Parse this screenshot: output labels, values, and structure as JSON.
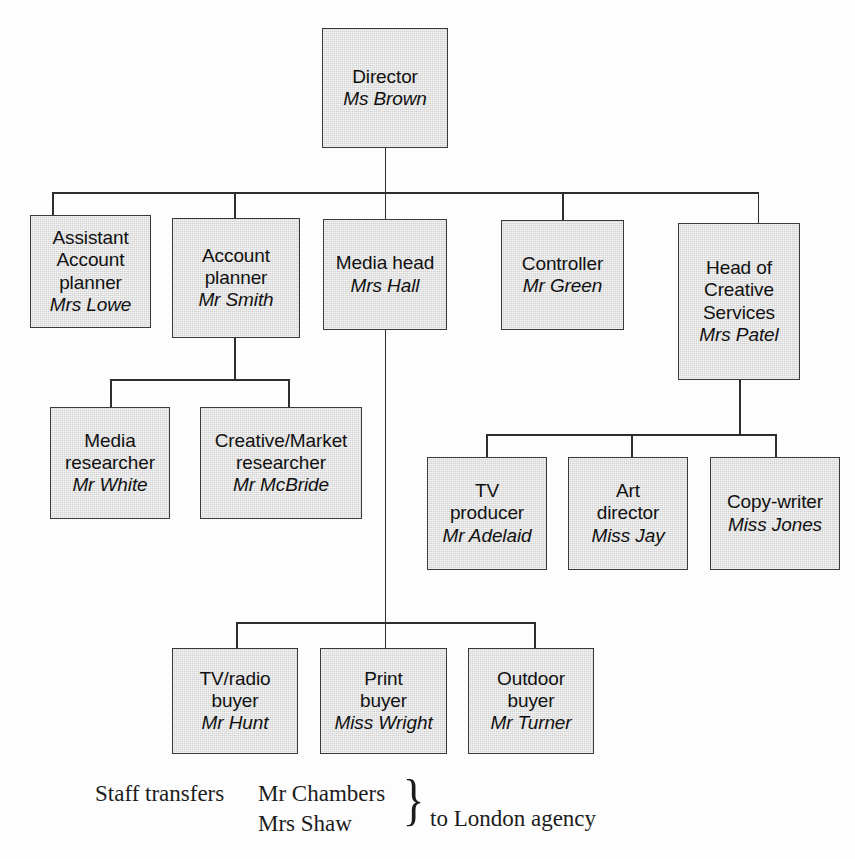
{
  "document": {
    "type": "organisation-chart",
    "clipped_header": ""
  },
  "nodes": {
    "director": {
      "role": "Director",
      "person": "Ms Brown"
    },
    "assistant_planner": {
      "role": "Assistant\nAccount\nplanner",
      "person": "Mrs Lowe"
    },
    "account_planner": {
      "role": "Account\nplanner",
      "person": "Mr Smith"
    },
    "media_head": {
      "role": "Media head",
      "person": "Mrs Hall"
    },
    "controller": {
      "role": "Controller",
      "person": "Mr Green"
    },
    "creative_head": {
      "role": "Head of\nCreative\nServices",
      "person": "Mrs Patel"
    },
    "media_researcher": {
      "role": "Media\nresearcher",
      "person": "Mr White"
    },
    "creative_researcher": {
      "role": "Creative/Market\nresearcher",
      "person": "Mr McBride"
    },
    "tv_producer": {
      "role": "TV\nproducer",
      "person": "Mr Adelaid"
    },
    "art_director": {
      "role": "Art\ndirector",
      "person": "Miss Jay"
    },
    "copywriter": {
      "role": "Copy-writer",
      "person": "Miss Jones"
    },
    "tv_radio_buyer": {
      "role": "TV/radio\nbuyer",
      "person": "Mr Hunt"
    },
    "print_buyer": {
      "role": "Print\nbuyer",
      "person": "Miss Wright"
    },
    "outdoor_buyer": {
      "role": "Outdoor\nbuyer",
      "person": "Mr Turner"
    }
  },
  "footnote": {
    "label": "Staff transfers",
    "name_1": "Mr Chambers",
    "name_2": "Mrs Shaw",
    "brace": "}",
    "destination": "to London agency"
  },
  "style": {
    "box_fill": "#d2d2d2",
    "box_border": "#3a3a3a",
    "line_color": "#2d2d2d",
    "text_color": "#111111",
    "page_background": "#fdfdfd"
  }
}
